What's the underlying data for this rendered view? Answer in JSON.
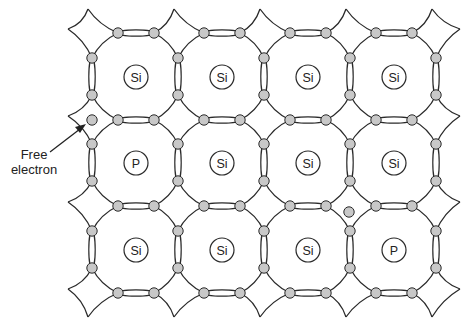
{
  "diagram": {
    "title": "",
    "type": "n-type semiconductor crystal lattice",
    "atom_grid": [
      [
        "Si",
        "Si",
        "Si",
        "Si"
      ],
      [
        "P",
        "Si",
        "Si",
        "Si"
      ],
      [
        "Si",
        "Si",
        "Si",
        "P"
      ]
    ],
    "labels": {
      "free_electron_line1": "Free",
      "free_electron_line2": "electron"
    },
    "colors": {
      "line": "#2a2a2a",
      "electron_fill": "#c8c8c8",
      "background": "#ffffff"
    },
    "free_electrons": [
      {
        "x": 92,
        "y": 120
      },
      {
        "x": 349,
        "y": 212
      }
    ]
  }
}
